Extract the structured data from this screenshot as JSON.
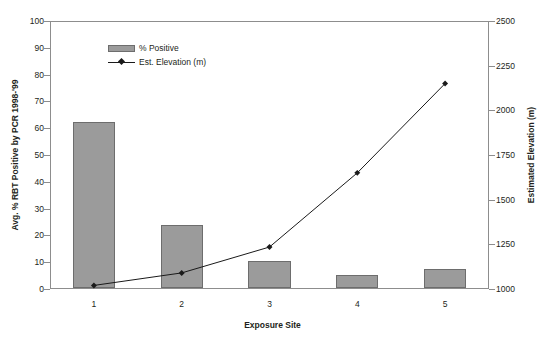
{
  "chart_data": {
    "type": "bar",
    "title": "",
    "xlabel": "Exposure Site",
    "ylabel": "Avg. % RBT Positive by PCR 1998-'99",
    "y2label": "Estimated Elevation (m)",
    "categories": [
      "1",
      "2",
      "3",
      "4",
      "5"
    ],
    "ylim": [
      0,
      100
    ],
    "y2lim": [
      1000,
      2500
    ],
    "yticks": [
      "0",
      "10",
      "20",
      "30",
      "40",
      "50",
      "60",
      "70",
      "80",
      "90",
      "100"
    ],
    "y2ticks": [
      "1000",
      "1250",
      "1500",
      "1750",
      "2000",
      "2250",
      "2500"
    ],
    "grid": false,
    "legend_position": "upper-left-inside",
    "series": [
      {
        "name": "% Positive",
        "kind": "bar",
        "axis": "left",
        "color": "#9b9b9b",
        "edge_color": "#6d6d6d",
        "values": [
          62,
          23.5,
          10,
          5,
          7
        ]
      },
      {
        "name": "Est. Elevation (m)",
        "kind": "line",
        "axis": "right",
        "color": "#1a1a1a",
        "marker": "diamond",
        "values": [
          1020,
          1090,
          1235,
          1650,
          2150
        ]
      }
    ]
  },
  "legend": {
    "items": [
      {
        "label": "% Positive"
      },
      {
        "label": "Est. Elevation (m)"
      }
    ]
  },
  "axes": {
    "left": {
      "title": "Avg. % RBT Positive by PCR 1998-'99",
      "ticks": [
        "100",
        "90",
        "80",
        "70",
        "60",
        "50",
        "40",
        "30",
        "20",
        "10",
        "0"
      ]
    },
    "right": {
      "title": "Estimated Elevation (m)",
      "ticks": [
        "2500",
        "2250",
        "2000",
        "1750",
        "1500",
        "1250",
        "1000"
      ]
    },
    "bottom": {
      "title": "Exposure Site",
      "ticks": [
        "1",
        "2",
        "3",
        "4",
        "5"
      ]
    }
  }
}
